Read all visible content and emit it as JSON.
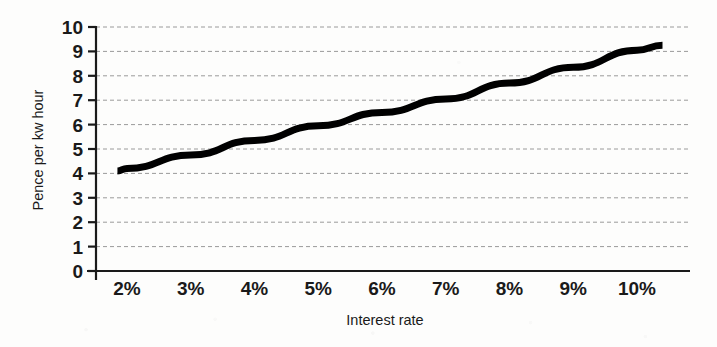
{
  "chart_data": {
    "type": "line",
    "title": "",
    "subtitle": "",
    "xlabel": "Interest rate",
    "ylabel": "Pence per kw hour",
    "xlim": [
      1.5,
      10.6
    ],
    "ylim": [
      0,
      10
    ],
    "grid": true,
    "grid_axis": "y",
    "legend": "none",
    "line_color": "#000000",
    "line_width_px": 7,
    "axis_color": "#1a1a1a",
    "gridline_color": "#9a9a9a",
    "gridline_style": "dashed",
    "x_tick_labels": [
      "2%",
      "3%",
      "4%",
      "5%",
      "6%",
      "7%",
      "8%",
      "9%",
      "10%"
    ],
    "x_tick_values": [
      2,
      3,
      4,
      5,
      6,
      7,
      8,
      9,
      10
    ],
    "y_tick_labels": [
      "0",
      "1",
      "2",
      "3",
      "4",
      "5",
      "6",
      "7",
      "8",
      "9",
      "10"
    ],
    "y_tick_values": [
      0,
      1,
      2,
      3,
      4,
      5,
      6,
      7,
      8,
      9,
      10
    ],
    "series": [
      {
        "name": "Cost of generation",
        "x": [
          1.85,
          2,
          3,
          4,
          5,
          6,
          7,
          8,
          9,
          10,
          10.4
        ],
        "values": [
          4.1,
          4.2,
          4.75,
          5.35,
          5.95,
          6.5,
          7.05,
          7.7,
          8.35,
          9.05,
          9.25
        ]
      }
    ]
  }
}
